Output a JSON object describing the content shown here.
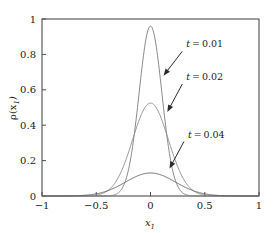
{
  "chart_data": {
    "type": "line",
    "title": "",
    "subtitle": "",
    "xlabel": "x_1",
    "xlabel_display": "x",
    "xlabel_sub": "1",
    "ylabel": "rho(x_1)",
    "ylabel_display": "ρ(x",
    "ylabel_sub": "1",
    "ylabel_close": ")",
    "xlim": [
      -1,
      1
    ],
    "ylim": [
      0,
      1
    ],
    "grid": false,
    "legend_position": "inline-annotations",
    "xticks": [
      -1,
      -0.5,
      0,
      0.5,
      1
    ],
    "xticklabels": [
      "−1",
      "−0.5",
      "0",
      "0.5",
      "1"
    ],
    "yticks": [
      0,
      0.2,
      0.4,
      0.6,
      0.8,
      1
    ],
    "yticklabels": [
      "0",
      "0.2",
      "0.4",
      "0.6",
      "0.8",
      "1"
    ],
    "series": [
      {
        "name": "t=0.01",
        "label": "t = 0.01",
        "color": "#7d7d7d",
        "peak_value": 0.96,
        "peak_x": 0.0,
        "sigma": 0.105,
        "x": [
          -0.6,
          -0.55,
          -0.5,
          -0.45,
          -0.4,
          -0.35,
          -0.3,
          -0.25,
          -0.2,
          -0.15,
          -0.1,
          -0.05,
          0.0,
          0.05,
          0.1,
          0.15,
          0.2,
          0.25,
          0.3,
          0.35,
          0.4,
          0.45,
          0.5,
          0.55,
          0.6
        ],
        "values": [
          0.0,
          0.0,
          0.001,
          0.003,
          0.014,
          0.046,
          0.122,
          0.253,
          0.42,
          0.582,
          0.779,
          0.92,
          0.96,
          0.92,
          0.779,
          0.582,
          0.42,
          0.253,
          0.122,
          0.046,
          0.014,
          0.003,
          0.001,
          0.0,
          0.0
        ]
      },
      {
        "name": "t=0.02",
        "label": "t = 0.02",
        "color": "#8a8a8a",
        "peak_value": 0.525,
        "peak_x": 0.0,
        "sigma": 0.165,
        "x": [
          -0.6,
          -0.55,
          -0.5,
          -0.45,
          -0.4,
          -0.35,
          -0.3,
          -0.25,
          -0.2,
          -0.15,
          -0.1,
          -0.05,
          0.0,
          0.05,
          0.1,
          0.15,
          0.2,
          0.25,
          0.3,
          0.35,
          0.4,
          0.45,
          0.5,
          0.55,
          0.6
        ],
        "values": [
          0.003,
          0.008,
          0.021,
          0.045,
          0.081,
          0.136,
          0.208,
          0.294,
          0.382,
          0.457,
          0.507,
          0.525,
          0.525,
          0.507,
          0.457,
          0.382,
          0.294,
          0.208,
          0.136,
          0.081,
          0.045,
          0.021,
          0.008,
          0.003,
          0.001
        ]
      },
      {
        "name": "t=0.04",
        "label": "t = 0.04",
        "color": "#5c5c5c",
        "peak_value": 0.13,
        "peak_x": 0.0,
        "sigma": 0.23,
        "x": [
          -0.6,
          -0.55,
          -0.5,
          -0.45,
          -0.4,
          -0.35,
          -0.3,
          -0.25,
          -0.2,
          -0.15,
          -0.1,
          -0.05,
          0.0,
          0.05,
          0.1,
          0.15,
          0.2,
          0.25,
          0.3,
          0.35,
          0.4,
          0.45,
          0.5,
          0.55,
          0.6
        ],
        "values": [
          0.005,
          0.01,
          0.018,
          0.031,
          0.048,
          0.068,
          0.089,
          0.106,
          0.119,
          0.127,
          0.13,
          0.13,
          0.13,
          0.13,
          0.13,
          0.127,
          0.119,
          0.106,
          0.089,
          0.068,
          0.048,
          0.031,
          0.018,
          0.01,
          0.005
        ]
      }
    ],
    "annotations": [
      {
        "name": "annotation-t-001",
        "text": "t = 0.01",
        "label_x": 0.33,
        "label_y": 0.84,
        "tip_x": 0.12,
        "tip_y": 0.68
      },
      {
        "name": "annotation-t-002",
        "text": "t = 0.02",
        "label_x": 0.33,
        "label_y": 0.655,
        "tip_x": 0.155,
        "tip_y": 0.475
      },
      {
        "name": "annotation-t-004",
        "text": "t = 0.04",
        "label_x": 0.345,
        "label_y": 0.33,
        "tip_x": 0.175,
        "tip_y": 0.155
      }
    ]
  }
}
